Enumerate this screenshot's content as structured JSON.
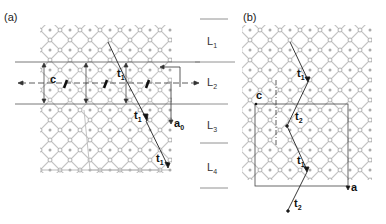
{
  "panels": {
    "a": {
      "label": "(a)",
      "vectors": {
        "c": "c",
        "t1_top": "t",
        "t1_top_sub": "1",
        "t1_mid": "t",
        "t1_mid_sub": "1",
        "t1_bot": "t",
        "t1_bot_sub": "1",
        "a0": "a",
        "a0_sub": "0"
      }
    },
    "b": {
      "label": "(b)",
      "vectors": {
        "c": "c",
        "t1_top": "t",
        "t1_top_sub": "1",
        "t2_mid": "t",
        "t2_mid_sub": "2",
        "t1_low": "t",
        "t1_low_sub": "1",
        "t2_bot": "t",
        "t2_bot_sub": "2",
        "a": "a"
      }
    }
  },
  "layers": [
    {
      "name": "L",
      "sub": "1"
    },
    {
      "name": "L",
      "sub": "2"
    },
    {
      "name": "L",
      "sub": "3"
    },
    {
      "name": "L",
      "sub": "4"
    }
  ],
  "colors": {
    "lattice": "#b8b8b8",
    "atom_stroke": "#999999",
    "line": "#333333"
  }
}
